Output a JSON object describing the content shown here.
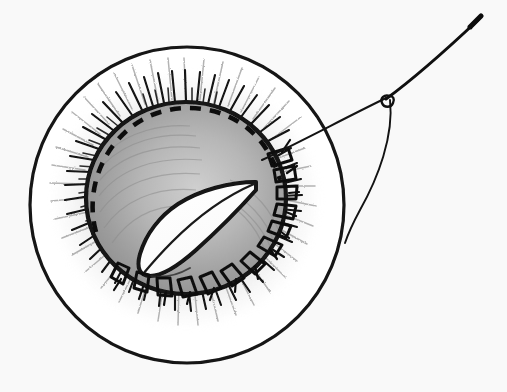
{
  "figure": {
    "description": "Hand-drawn pencil and ink medical illustration of a circular surgical field containing an everted wound with a raised tissue flap, interrupted sutures along the lower and right margins, a dashed planned-incision line along the upper margin, radiating hair or lash strokes around the wound, and a curved surgical needle threaded with suture entering from the upper right.",
    "medium": "pencil-and-ink-line-drawing",
    "background_color": "#f9f9f9",
    "ink_color": "#141414",
    "shading_light": "#c9c9c9",
    "shading_mid": "#a8a8a8",
    "shading_dark": "#8a8a8a"
  },
  "field": {
    "label": "circular operative field",
    "center_x": 187,
    "center_y": 205,
    "radius": 157,
    "stroke_width": 3.2,
    "fill": "#ffffff"
  },
  "wound": {
    "label": "everted wound margin",
    "center_x": 186,
    "center_y": 198,
    "radius_x": 100,
    "radius_y": 96,
    "stroke_width": 4.2
  },
  "flap": {
    "label": "raised tissue flap",
    "fill": "#ffffff",
    "stroke_width": 4.0
  },
  "incision_line": {
    "label": "dashed planned incision line",
    "style": "dashed",
    "dash_pattern": "11 9",
    "stroke_width": 4.5
  },
  "sutures": {
    "label": "interrupted sutures",
    "count": 13,
    "stroke_width": 3.0
  },
  "lashes": {
    "label": "radiating hair strokes",
    "count": 78,
    "stroke_width": 1.9
  },
  "needle": {
    "label": "curved surgical needle",
    "tip_x": 480,
    "tip_y": 18,
    "eye_x": 389,
    "eye_y": 97,
    "stroke_width": 2.2
  },
  "thread": {
    "label": "suture thread",
    "tail_x": 345,
    "tail_y": 243,
    "stroke_width": 1.9
  }
}
